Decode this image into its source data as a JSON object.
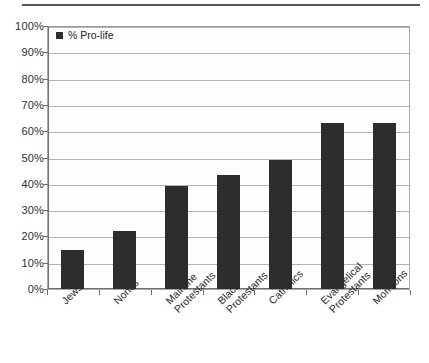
{
  "chart_data": {
    "type": "bar",
    "title": "",
    "subtitle": "",
    "xlabel": "",
    "ylabel": "",
    "categories": [
      "Jews",
      "Nones",
      "Mainline Protestants",
      "Black Protestants",
      "Catholics",
      "Evangelical Protestants",
      "Mormons"
    ],
    "category_lines": [
      [
        "Jews",
        ""
      ],
      [
        "Nones",
        ""
      ],
      [
        "Mainline",
        "Protestants"
      ],
      [
        "Black",
        "Protestants"
      ],
      [
        "Catholics",
        ""
      ],
      [
        "Evangelical",
        "Protestants"
      ],
      [
        "Mormons",
        ""
      ]
    ],
    "values": [
      15,
      22,
      39,
      43.5,
      49,
      63,
      63
    ],
    "series": [
      {
        "name": "% Pro-life",
        "values": [
          15,
          22,
          39,
          43.5,
          49,
          63,
          63
        ]
      }
    ],
    "ylim": [
      0,
      100
    ],
    "ytick_values": [
      0,
      10,
      20,
      30,
      40,
      50,
      60,
      70,
      80,
      90,
      100
    ],
    "ytick_labels": [
      "0%",
      "10%",
      "20%",
      "30%",
      "40%",
      "50%",
      "60%",
      "70%",
      "80%",
      "90%",
      "100%"
    ],
    "grid": true,
    "legend": {
      "position": "top-left-inside",
      "entries": [
        {
          "label": "% Pro-life",
          "color": "#2f2c2c",
          "marker": "square"
        }
      ]
    },
    "colors": {
      "bar": "#2f2c2c",
      "grid": "#b4b4b4",
      "axis": "#6f6f6f",
      "frame": "#a9a9a9",
      "background": "#ffffff",
      "text": "#2b2b2b"
    }
  }
}
